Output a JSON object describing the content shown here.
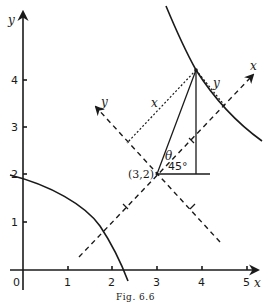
{
  "figure": {
    "caption": "Fig. 6.6",
    "point_label": "(3,2)",
    "angle_theta_label": "θ",
    "angle_45_label": "45°"
  },
  "axes": {
    "x_label": "x",
    "y_label": "y",
    "origin_label": "0",
    "x_ticks": [
      "1",
      "2",
      "3",
      "4",
      "5"
    ],
    "y_ticks": [
      "1",
      "2",
      "3",
      "4"
    ]
  },
  "rotated_axes": {
    "x_prime_label": "x",
    "y_prime_label": "y",
    "origin": [
      3,
      2
    ],
    "rotation_deg": 45
  },
  "segment_labels": {
    "x_distance": "x",
    "y_distance": "y"
  },
  "colors": {
    "ink": "#1a1a1a",
    "paper": "#ffffff"
  }
}
